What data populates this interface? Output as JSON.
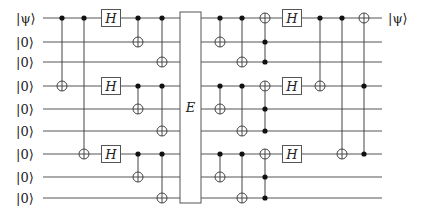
{
  "circuit": {
    "title": "Shor 9-qubit code with error channel",
    "wires": [
      {
        "y": 18,
        "in_label": "|ψ⟩",
        "out_label": "|ψ⟩"
      },
      {
        "y": 42,
        "in_label": "|0⟩",
        "out_label": ""
      },
      {
        "y": 62,
        "in_label": "|0⟩",
        "out_label": ""
      },
      {
        "y": 86,
        "in_label": "|0⟩",
        "out_label": ""
      },
      {
        "y": 109,
        "in_label": "|0⟩",
        "out_label": ""
      },
      {
        "y": 131,
        "in_label": "|0⟩",
        "out_label": ""
      },
      {
        "y": 154,
        "in_label": "|0⟩",
        "out_label": ""
      },
      {
        "y": 177,
        "in_label": "|0⟩",
        "out_label": ""
      },
      {
        "y": 198,
        "in_label": "|0⟩",
        "out_label": ""
      }
    ],
    "wire_x_start": 43,
    "wire_x_end": 382,
    "input_label_x": 16,
    "output_label_x": 388,
    "gates": [
      {
        "type": "cnot",
        "x": 62,
        "controls": [
          0
        ],
        "target": 3
      },
      {
        "type": "cnot",
        "x": 84,
        "controls": [
          0
        ],
        "target": 6
      },
      {
        "type": "h",
        "x": 111,
        "qubits": [
          0,
          3,
          6
        ],
        "label": "H"
      },
      {
        "type": "cnot",
        "x": 138,
        "controls": [
          0
        ],
        "target": 1
      },
      {
        "type": "cnot",
        "x": 138,
        "controls": [
          3
        ],
        "target": 4
      },
      {
        "type": "cnot",
        "x": 138,
        "controls": [
          6
        ],
        "target": 7
      },
      {
        "type": "cnot",
        "x": 162,
        "controls": [
          0
        ],
        "target": 2
      },
      {
        "type": "cnot",
        "x": 162,
        "controls": [
          3
        ],
        "target": 5
      },
      {
        "type": "cnot",
        "x": 162,
        "controls": [
          6
        ],
        "target": 8
      },
      {
        "type": "block",
        "x0": 180,
        "x1": 201,
        "y0": 12,
        "y1": 203,
        "label": "E"
      },
      {
        "type": "cnot",
        "x": 220,
        "controls": [
          0
        ],
        "target": 1
      },
      {
        "type": "cnot",
        "x": 220,
        "controls": [
          3
        ],
        "target": 4
      },
      {
        "type": "cnot",
        "x": 220,
        "controls": [
          6
        ],
        "target": 7
      },
      {
        "type": "cnot",
        "x": 242,
        "controls": [
          0
        ],
        "target": 2
      },
      {
        "type": "cnot",
        "x": 242,
        "controls": [
          3
        ],
        "target": 5
      },
      {
        "type": "cnot",
        "x": 242,
        "controls": [
          6
        ],
        "target": 8
      },
      {
        "type": "toffoli",
        "x": 265,
        "controls": [
          1,
          2
        ],
        "target": 0
      },
      {
        "type": "toffoli",
        "x": 265,
        "controls": [
          4,
          5
        ],
        "target": 3
      },
      {
        "type": "toffoli",
        "x": 265,
        "controls": [
          7,
          8
        ],
        "target": 6
      },
      {
        "type": "h",
        "x": 292,
        "qubits": [
          0,
          3,
          6
        ],
        "label": "H"
      },
      {
        "type": "cnot",
        "x": 320,
        "controls": [
          0
        ],
        "target": 3
      },
      {
        "type": "cnot",
        "x": 342,
        "controls": [
          0
        ],
        "target": 6
      },
      {
        "type": "toffoli",
        "x": 364,
        "controls": [
          3,
          6
        ],
        "target": 0
      }
    ]
  },
  "colors": {
    "wire": "#555555",
    "control": "#111111",
    "target_fill": "#ffffff",
    "text": "#222222",
    "background": "#ffffff"
  }
}
